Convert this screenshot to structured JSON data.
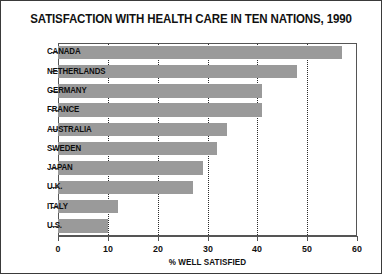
{
  "chart_data": {
    "type": "bar",
    "orientation": "horizontal",
    "title": "SATISFACTION WITH HEALTH CARE IN TEN NATIONS, 1990",
    "xlabel": "% WELL SATISFIED",
    "ylabel": "",
    "categories": [
      "CANADA",
      "NETHERLANDS",
      "GERMANY",
      "FRANCE",
      "AUSTRALIA",
      "SWEDEN",
      "JAPAN",
      "U.K.",
      "ITALY",
      "U.S."
    ],
    "values": [
      57,
      48,
      41,
      41,
      34,
      32,
      29,
      27,
      12,
      10
    ],
    "xlim": [
      0,
      60
    ],
    "xticks": [
      0,
      10,
      20,
      30,
      40,
      50,
      60
    ],
    "xticklabels": [
      "0",
      "10",
      "20",
      "30",
      "40",
      "50",
      "60"
    ],
    "gridlines_at": [
      10,
      20,
      30,
      40,
      50
    ],
    "grid": true,
    "grid_style": "dotted-vertical",
    "legend": "none",
    "bar_color": "#9a9a9a",
    "background_color": "#ffffff",
    "axis_color": "#555555",
    "text_color": "#111111",
    "border_color": "#3a3a3a"
  }
}
